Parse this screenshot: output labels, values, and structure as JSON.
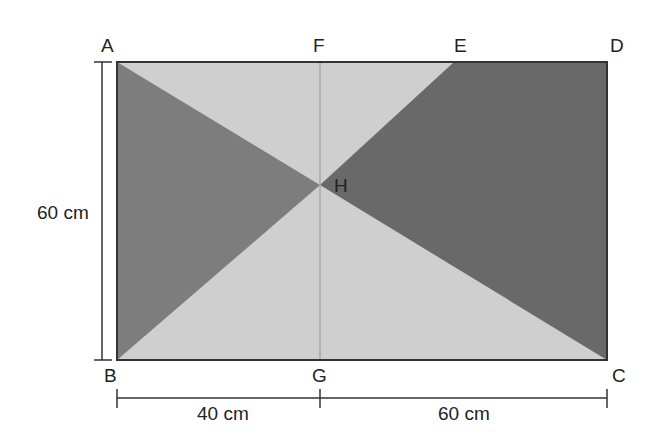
{
  "diagram": {
    "type": "geometry-rectangle",
    "points": {
      "A": {
        "label": "A",
        "x": 117,
        "y": 62
      },
      "F": {
        "label": "F",
        "x": 320,
        "y": 62
      },
      "E": {
        "label": "E",
        "x": 454,
        "y": 62
      },
      "D": {
        "label": "D",
        "x": 607,
        "y": 62
      },
      "B": {
        "label": "B",
        "x": 117,
        "y": 360
      },
      "G": {
        "label": "G",
        "x": 320,
        "y": 360
      },
      "C": {
        "label": "C",
        "x": 607,
        "y": 360
      },
      "H": {
        "label": "H",
        "x": 320,
        "y": 185
      }
    },
    "dimensions": {
      "height": "60 cm",
      "bottom_left": "40 cm",
      "bottom_right": "60 cm"
    },
    "colors": {
      "light": "#cfcfcf",
      "dark_left": "#7d7d7d",
      "dark_right": "#696969",
      "stroke": "#333333",
      "divider": "#a8a8a8"
    }
  }
}
